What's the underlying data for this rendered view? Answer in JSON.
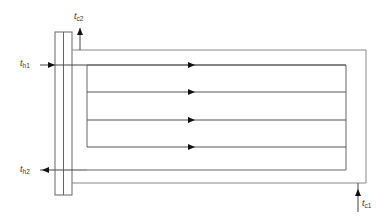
{
  "diagram": {
    "type": "heat-exchanger-flow-schematic",
    "labels": {
      "hot_inlet": {
        "main": "t",
        "sub": "h1"
      },
      "hot_outlet": {
        "main": "t",
        "sub": "h2"
      },
      "cold_inlet": {
        "main": "t",
        "sub": "c1"
      },
      "cold_outlet": {
        "main": "t",
        "sub": "c2"
      }
    },
    "colors": {
      "line": "#555555",
      "shell": "#888888",
      "arrow": "#111111",
      "background": "#ffffff"
    },
    "flow_passes": 4
  }
}
